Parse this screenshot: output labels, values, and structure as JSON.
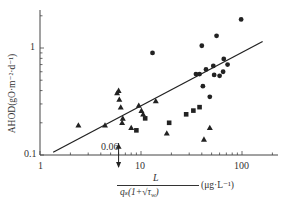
{
  "chart_data": {
    "type": "scatter",
    "title": "",
    "xlabel_numerator": "L",
    "xlabel_denominator": "q_s(1+√τ_w)",
    "xlabel_unit": "(μg·L⁻¹)",
    "ylabel": "AHOD(gO·m⁻²·d⁻¹)",
    "xscale": "log",
    "yscale": "log",
    "xlim": [
      1,
      200
    ],
    "ylim": [
      0.1,
      2.5
    ],
    "x_ticks": [
      1,
      10,
      100
    ],
    "x_tick_labels": [
      "1",
      "10",
      "100"
    ],
    "y_ticks": [
      0.1,
      1
    ],
    "y_tick_labels": [
      "0.1",
      "1"
    ],
    "annotation": {
      "text": "0.06",
      "x": 6,
      "y": 0.1,
      "arrow": "down"
    },
    "regression_line": {
      "x": [
        1.35,
        160
      ],
      "y": [
        0.106,
        1.15
      ]
    },
    "series": [
      {
        "name": "circles",
        "marker": "circle",
        "points": [
          [
            13,
            0.9
          ],
          [
            35,
            0.57
          ],
          [
            38,
            0.57
          ],
          [
            40,
            1.05
          ],
          [
            44,
            0.63
          ],
          [
            52,
            0.68
          ],
          [
            53,
            0.56
          ],
          [
            56,
            1.3
          ],
          [
            60,
            0.55
          ],
          [
            65,
            0.6
          ],
          [
            66,
            0.79
          ],
          [
            72,
            0.7
          ],
          [
            98,
            1.85
          ],
          [
            41,
            0.44
          ],
          [
            48,
            0.35
          ]
        ]
      },
      {
        "name": "triangles",
        "marker": "triangle",
        "points": [
          [
            2.4,
            0.19
          ],
          [
            4.4,
            0.19
          ],
          [
            5.8,
            0.38
          ],
          [
            6.0,
            0.4
          ],
          [
            6.1,
            0.33
          ],
          [
            6.3,
            0.28
          ],
          [
            6.5,
            0.2
          ],
          [
            6.6,
            0.22
          ],
          [
            8.0,
            0.18
          ],
          [
            10.1,
            0.26
          ],
          [
            10.5,
            0.24
          ],
          [
            9.5,
            0.29
          ],
          [
            14,
            0.32
          ],
          [
            18,
            0.16
          ],
          [
            42,
            0.14
          ],
          [
            48,
            0.18
          ],
          [
            6.0,
            0.12
          ]
        ]
      },
      {
        "name": "squares",
        "marker": "square",
        "points": [
          [
            9.0,
            0.17
          ],
          [
            11,
            0.22
          ],
          [
            19,
            0.2
          ],
          [
            28,
            0.24
          ],
          [
            33,
            0.26
          ],
          [
            38,
            0.28
          ]
        ]
      }
    ]
  },
  "axes": {
    "y_tick_1": "1",
    "y_tick_01": "0.1",
    "x_tick_1": "1",
    "x_tick_10": "10",
    "x_tick_100": "100",
    "annotation": "0.06",
    "ylabel": "AHOD(gO·m⁻²·d⁻¹)",
    "x_num": "L",
    "x_den": "qₛ(1+√τ",
    "x_den_sub": "w",
    "x_den_end": ")",
    "x_unit": "(μg·L⁻¹)"
  }
}
